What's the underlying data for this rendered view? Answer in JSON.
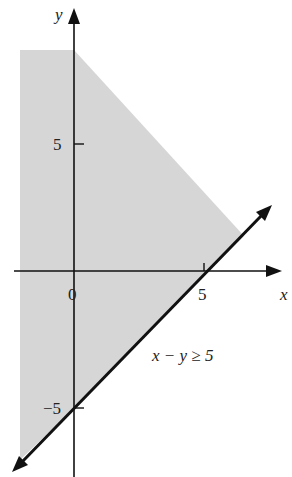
{
  "graph": {
    "x_axis_label": "x",
    "y_axis_label": "y",
    "x_ticks": [
      {
        "value": 0,
        "label": "0"
      },
      {
        "value": 5,
        "label": "5"
      }
    ],
    "y_ticks": [
      {
        "value": 5,
        "label": "5"
      },
      {
        "value": -5,
        "label": "−5"
      }
    ],
    "inequality_label": "x − y ≥ 5",
    "boundary_line": "y = x - 5",
    "colors": {
      "shade": "#d4d4d4",
      "line": "#111111"
    }
  }
}
